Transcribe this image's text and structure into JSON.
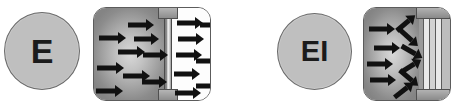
{
  "figure": {
    "type": "schematic-diagram",
    "background_color": "#ffffff",
    "arrow_color": "#111111",
    "chamber_dark_color": "#a4a4a4",
    "chamber_light_color": "#fdfdfd",
    "outline_color": "#5c5c5c"
  },
  "panels": [
    {
      "id": "panel-e",
      "symbol": {
        "label": "E",
        "shape": "circle",
        "fill": "#bfbfbf",
        "stroke": "#6b6b6b"
      },
      "diagram": {
        "name": "open-channel-box",
        "shape": "rounded-rectangle",
        "left_chamber": "gradient-shaded",
        "right_chamber": "white",
        "divider": "membrane-with-open-pore",
        "left_arrows": 9,
        "right_arrows": 8,
        "arrow_direction": "left-to-right",
        "flow_state": "passing-through"
      }
    },
    {
      "id": "panel-ei",
      "symbol": {
        "label": "EI",
        "shape": "circle",
        "fill": "#bfbfbf",
        "stroke": "#6b6b6b"
      },
      "diagram": {
        "name": "blocked-channel-box",
        "shape": "rounded-rectangle",
        "left_chamber": "gradient-shaded",
        "right_chamber": "striped-column",
        "divider": "solid-column-block",
        "left_arrows": 4,
        "deflected_arrows": 6,
        "arrow_direction": "converging-and-deflected",
        "flow_state": "blocked"
      }
    }
  ],
  "arrows": {
    "panel_e_left": [
      {
        "x": 34,
        "y": 11,
        "len": 18,
        "rot": 0
      },
      {
        "x": 5,
        "y": 24,
        "len": 19,
        "rot": 0
      },
      {
        "x": 40,
        "y": 25,
        "len": 17,
        "rot": 0
      },
      {
        "x": 24,
        "y": 38,
        "len": 19,
        "rot": 0
      },
      {
        "x": 49,
        "y": 41,
        "len": 17,
        "rot": 0
      },
      {
        "x": 3,
        "y": 54,
        "len": 19,
        "rot": 0
      },
      {
        "x": 29,
        "y": 62,
        "len": 19,
        "rot": 0
      },
      {
        "x": 48,
        "y": 68,
        "len": 17,
        "rot": 0
      },
      {
        "x": 2,
        "y": 77,
        "len": 19,
        "rot": 0
      }
    ],
    "panel_e_right": [
      {
        "x": 5,
        "y": 9,
        "len": 18,
        "rot": 0
      },
      {
        "x": 28,
        "y": 11,
        "len": 18,
        "rot": 0
      },
      {
        "x": 6,
        "y": 25,
        "len": 18,
        "rot": 0
      },
      {
        "x": 4,
        "y": 41,
        "len": 18,
        "rot": 0
      },
      {
        "x": 24,
        "y": 47,
        "len": 18,
        "rot": 0
      },
      {
        "x": 2,
        "y": 60,
        "len": 18,
        "rot": 0
      },
      {
        "x": 24,
        "y": 72,
        "len": 18,
        "rot": 0
      },
      {
        "x": 3,
        "y": 79,
        "len": 18,
        "rot": 0
      }
    ],
    "panel_ei_left": [
      {
        "x": 5,
        "y": 15,
        "len": 18,
        "rot": 0
      },
      {
        "x": 10,
        "y": 34,
        "len": 18,
        "rot": 0
      },
      {
        "x": 3,
        "y": 50,
        "len": 18,
        "rot": 0
      },
      {
        "x": 6,
        "y": 66,
        "len": 18,
        "rot": 0
      }
    ],
    "panel_ei_deflected": [
      {
        "x": 30,
        "y": 9,
        "len": 16,
        "rot": -40
      },
      {
        "x": 33,
        "y": 24,
        "len": 16,
        "rot": 42
      },
      {
        "x": 36,
        "y": 38,
        "len": 16,
        "rot": 30
      },
      {
        "x": 35,
        "y": 52,
        "len": 16,
        "rot": -32
      },
      {
        "x": 33,
        "y": 64,
        "len": 16,
        "rot": 40
      },
      {
        "x": 28,
        "y": 76,
        "len": 16,
        "rot": -38
      }
    ]
  }
}
